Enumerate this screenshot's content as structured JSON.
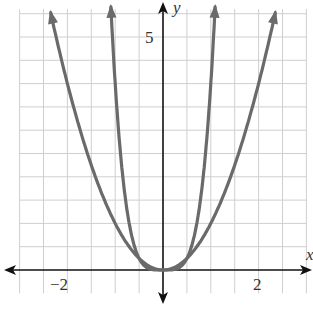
{
  "chart_data": {
    "type": "line",
    "title": "",
    "xlabel": "x",
    "ylabel": "y",
    "xlim": [
      -3.2,
      3.1
    ],
    "ylim": [
      -0.6,
      5.7
    ],
    "grid": true,
    "grid_step": 0.5,
    "tick_labels": {
      "x": [
        "-2",
        "2"
      ],
      "y": [
        "5"
      ]
    },
    "series": [
      {
        "name": "y = x^2",
        "color": "#666666",
        "points": [
          [
            -2.35,
            5.52
          ],
          [
            -2,
            4
          ],
          [
            -1.5,
            2.25
          ],
          [
            -1,
            1
          ],
          [
            -0.5,
            0.25
          ],
          [
            0,
            0
          ],
          [
            0.5,
            0.25
          ],
          [
            1,
            1
          ],
          [
            1.5,
            2.25
          ],
          [
            2,
            4
          ],
          [
            2.35,
            5.52
          ]
        ]
      },
      {
        "name": "y = 4x^4",
        "color": "#666666",
        "points": [
          [
            -1.09,
            5.6
          ],
          [
            -1,
            4
          ],
          [
            -0.75,
            1.27
          ],
          [
            -0.5,
            0.25
          ],
          [
            -0.25,
            0.016
          ],
          [
            0,
            0
          ],
          [
            0.25,
            0.016
          ],
          [
            0.5,
            0.25
          ],
          [
            0.75,
            1.27
          ],
          [
            1,
            4
          ],
          [
            1.09,
            5.6
          ]
        ]
      }
    ]
  },
  "labels": {
    "x_axis": "x",
    "y_axis": "y",
    "x_neg2": "−2",
    "x_pos2": "2",
    "y_5": "5"
  }
}
